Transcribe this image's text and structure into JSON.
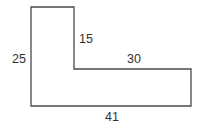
{
  "diagram": {
    "type": "L-shaped polygon with dimension labels",
    "stroke_color": "#4a4a4a",
    "fill_color": "#ffffff",
    "text_color": "#333333",
    "vertices": [
      [
        31,
        7
      ],
      [
        74,
        7
      ],
      [
        74,
        69
      ],
      [
        191,
        69
      ],
      [
        191,
        106
      ],
      [
        31,
        106
      ]
    ],
    "labels": {
      "left_height": "25",
      "inner_vertical": "15",
      "inner_horizontal": "30",
      "bottom_width": "41"
    }
  }
}
